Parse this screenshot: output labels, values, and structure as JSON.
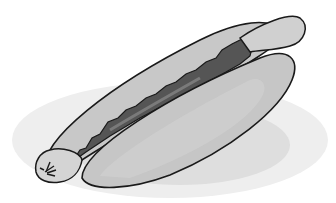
{
  "image": {
    "subject": "hot dog on a plate",
    "style": "grayscale clip-art",
    "colors": {
      "background": "#ffffff",
      "plate": "#ececec",
      "plate_shadow": "#dcdcdc",
      "bun": "#c4c4c4",
      "bun_light": "#d2d2d2",
      "sausage": "#b8b8b8",
      "sausage_end": "#d0d0d0",
      "topping": "#555555",
      "topping_highlight": "#8a8a8a",
      "outline": "#1a1a1a"
    }
  }
}
